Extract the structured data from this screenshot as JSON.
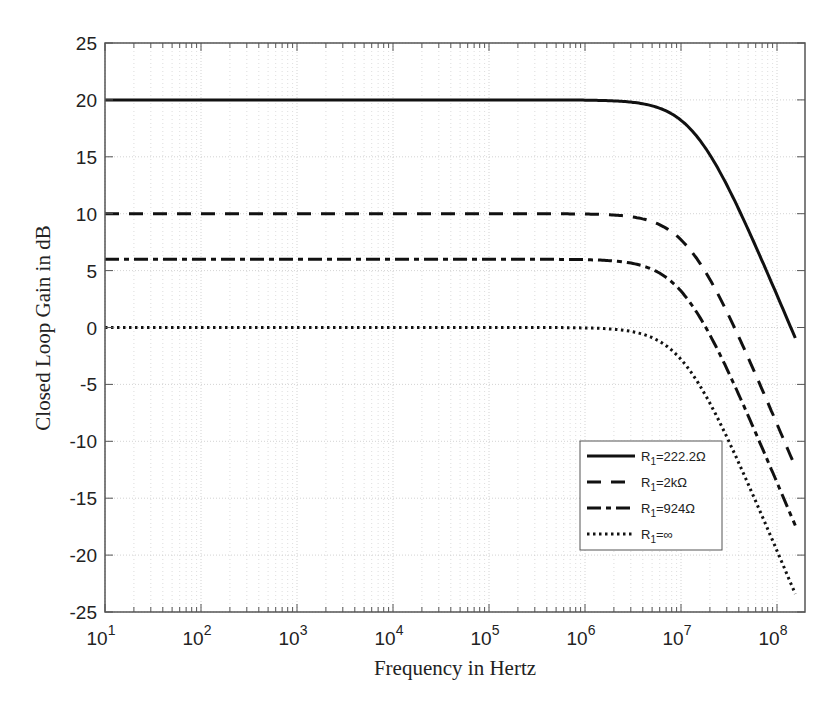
{
  "chart_data": {
    "type": "line",
    "title": "",
    "xlabel": "Frequency in Hertz",
    "ylabel": "Closed Loop Gain in dB",
    "xscale": "log",
    "xlim": [
      10,
      200000000
    ],
    "ylim": [
      -25,
      25
    ],
    "grid": true,
    "x_ticks": [
      "10^1",
      "10^2",
      "10^3",
      "10^4",
      "10^5",
      "10^6",
      "10^7",
      "10^8"
    ],
    "y_ticks": [
      25,
      20,
      15,
      10,
      5,
      0,
      -5,
      -10,
      -15,
      -20,
      -25
    ],
    "legend_position": "lower right",
    "series": [
      {
        "name": "R1=222.2Ω",
        "style": "solid",
        "dc_gain_db": 20,
        "corner_hz": 14000000,
        "x": [
          10,
          1000000,
          5000000,
          10000000,
          20000000,
          50000000,
          155000000
        ],
        "y": [
          20,
          19.9,
          19.4,
          18.2,
          15.2,
          8.6,
          -1.5
        ]
      },
      {
        "name": "R1=2kΩ",
        "style": "dashed",
        "dc_gain_db": 10,
        "corner_hz": 12000000,
        "x": [
          10,
          1000000,
          5000000,
          10000000,
          20000000,
          50000000,
          155000000
        ],
        "y": [
          10,
          9.9,
          9.3,
          7.9,
          4.8,
          -1.5,
          -11.5
        ]
      },
      {
        "name": "R1=924Ω",
        "style": "dashdot",
        "dc_gain_db": 6,
        "corner_hz": 10500000,
        "x": [
          10,
          1000000,
          5000000,
          10000000,
          20000000,
          50000000,
          155000000
        ],
        "y": [
          6,
          5.9,
          5.2,
          3.6,
          0.5,
          -7.8,
          -15.5
        ]
      },
      {
        "name": "R1=∞",
        "style": "dotted",
        "dc_gain_db": 0,
        "corner_hz": 10500000,
        "x": [
          10,
          1000000,
          5000000,
          10000000,
          20000000,
          50000000,
          155000000
        ],
        "y": [
          0,
          -0.1,
          -0.8,
          -2.4,
          -5.5,
          -13.8,
          -21.5
        ]
      }
    ]
  },
  "labels": {
    "xlabel": "Frequency in Hertz",
    "ylabel": "Closed Loop Gain in dB",
    "legend": [
      {
        "prefix": "R",
        "sub": "1",
        "suffix": "=222.2Ω"
      },
      {
        "prefix": "R",
        "sub": "1",
        "suffix": "=2kΩ"
      },
      {
        "prefix": "R",
        "sub": "1",
        "suffix": "=924Ω"
      },
      {
        "prefix": "R",
        "sub": "1",
        "suffix": "=∞"
      }
    ]
  }
}
